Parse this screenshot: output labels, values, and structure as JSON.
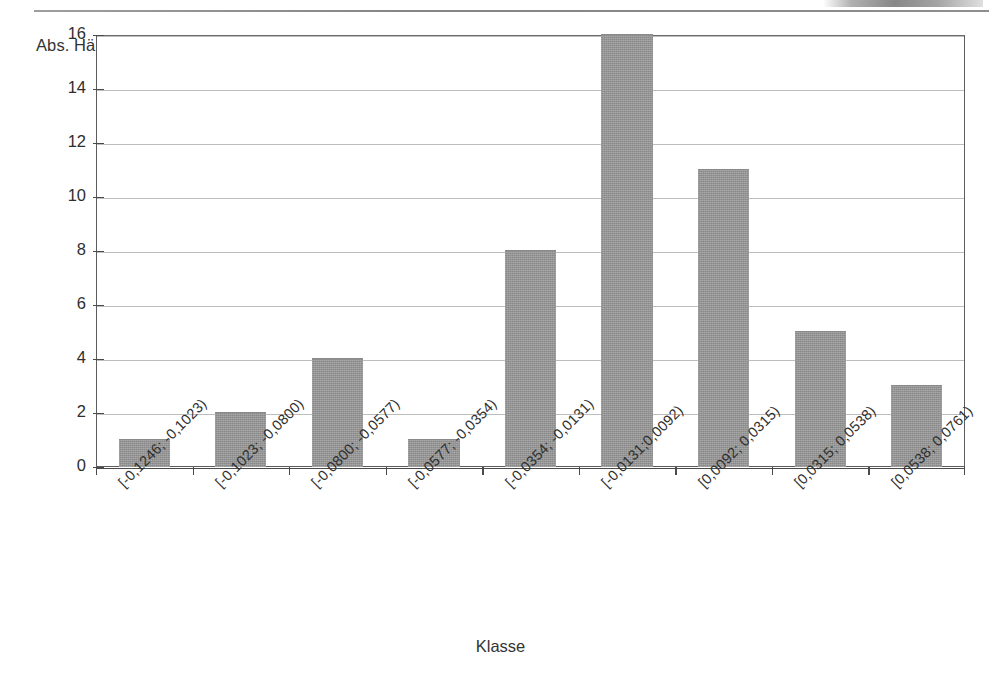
{
  "page": {
    "header_rule_label": "page-header-rule",
    "header_text_cropped": ""
  },
  "chart_data": {
    "type": "bar",
    "title": "",
    "subtitle": "",
    "xlabel": "Klasse",
    "ylabel": "Abs. Häufigkeit",
    "ylim": [
      0,
      16
    ],
    "y_ticks": [
      0,
      2,
      4,
      6,
      8,
      10,
      12,
      14,
      16
    ],
    "y_tick_labels": [
      "0",
      "2",
      "4",
      "6",
      "8",
      "10",
      "12",
      "14",
      "16"
    ],
    "grid": true,
    "legend": null,
    "legend_position": "none",
    "bar_color": "#969696",
    "categories": [
      "[-0,1246; -0,1023)",
      "[-0,1023; -0,0800)",
      "[-0,0800; -0,0577)",
      "[-0,0577; -0,0354)",
      "[-0,0354; -0,0131)",
      "[-0,0131;0,0092)",
      "[0,0092; 0,0315)",
      "[0,0315; 0,0538)",
      "[0,0538; 0,0761)"
    ],
    "values": [
      1,
      2,
      4,
      1,
      8,
      16,
      11,
      5,
      3
    ]
  }
}
